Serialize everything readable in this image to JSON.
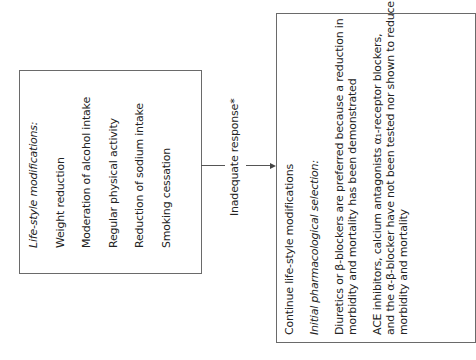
{
  "left_box": {
    "heading": "Life-style modifications:",
    "items": [
      "Weight reduction",
      "Moderation of alcohol intake",
      "Regular physical activity",
      "Reduction of sodium intake",
      "Smoking cessation"
    ]
  },
  "connector": {
    "label": "Inadequate response*"
  },
  "right_box": {
    "line1": "Continue life-style modifications",
    "heading": "Initial pharmacological selection:",
    "para1": [
      "Diuretics or β-blockers are preferred because a reduction in",
      "morbidity and mortality has been demonstrated"
    ],
    "para2": [
      "ACE inhibitors, calcium antagonists α₁-receptor blockers,",
      "and the α-β-blocker have not been tested nor shown to reduce",
      "morbidity and mortality"
    ]
  },
  "colors": {
    "border": "#6a6a6a",
    "text": "#222222",
    "background": "#ffffff"
  }
}
